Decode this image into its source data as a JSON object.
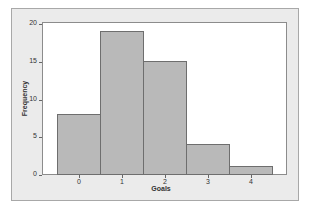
{
  "chart_data": {
    "type": "bar",
    "subtype": "histogram",
    "title": "",
    "xlabel": "Goals",
    "ylabel": "Frequency",
    "categories": [
      "0",
      "1",
      "2",
      "3",
      "4"
    ],
    "values": [
      8,
      19,
      15,
      4,
      1
    ],
    "ylim": [
      0,
      20
    ],
    "yticks": [
      0,
      5,
      10,
      15,
      20
    ],
    "xticks": [
      "0",
      "1",
      "2",
      "3",
      "4"
    ],
    "grid": false,
    "legend": null,
    "colors": {
      "bar_fill": "#b9b9b9",
      "bar_edge": "#6e6e6e",
      "frame_bg": "#ebebeb",
      "plot_bg": "#ffffff"
    }
  },
  "labels": {
    "xlabel": "Goals",
    "ylabel": "Frequency",
    "yticks": [
      "0",
      "5",
      "10",
      "15",
      "20"
    ],
    "xticks": [
      "0",
      "1",
      "2",
      "3",
      "4"
    ]
  }
}
